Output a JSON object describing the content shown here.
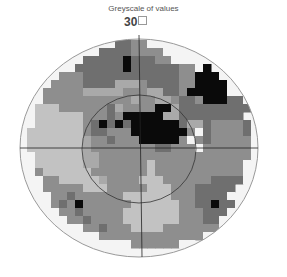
{
  "title": "Greyscale of values",
  "scale_label": "30",
  "chart_data": {
    "type": "heatmap",
    "title": "Greyscale of values",
    "annotations": [
      "30°"
    ],
    "levels": {
      "0": "#f4f4f4",
      "1": "#c2c2c2",
      "2": "#a9a9a9",
      "3": "#8e8e8e",
      "4": "#6f6f6f",
      "5": "#0a0a0a"
    },
    "grid": {
      "cell": 8,
      "origin_x": 19,
      "origin_y": 40,
      "rows": [
        "...........0443300...........",
        "........00444433330000........",
        "......00444445444330000.......",
        ".....0044444454444443305......",
        "....03334444444444443355500...",
        "...033334444222344443355550...",
        "..0333332222233322443555550...",
        "..033333333333233223443555440.",
        ".01113333334233335524444444440",
        ".011111133343555552244444444.0",
        ".01111113454545555554224333340",
        "011111113443335555555304333340",
        "011111112334333555553034333330",
        "011111112333333334433303333330",
        ".01111112233333333333333333330",
        ".0111111223333331333333333330.",
        ".0311111133333331333333333330.",
        "..033111112333311133333344440.",
        "..0333331113333311133344444..",
        "...033433333311111133344440..",
        "...0343533333311111133445440..",
        "....033433333111111133344400..",
        ".....0334333311111113334400...",
        "......00334333111133333330....",
        "........00333333333333300.....",
        "..........000033333300........",
        "..........................."
      ]
    },
    "meridians": {
      "horizontal_y": 148,
      "vertical_x": 139
    },
    "outer_circle": {
      "cx": 139,
      "cy": 148,
      "rx": 119,
      "ry": 109
    },
    "inner_circle": {
      "cx": 139,
      "cy": 149,
      "rx": 57,
      "ry": 54
    }
  }
}
